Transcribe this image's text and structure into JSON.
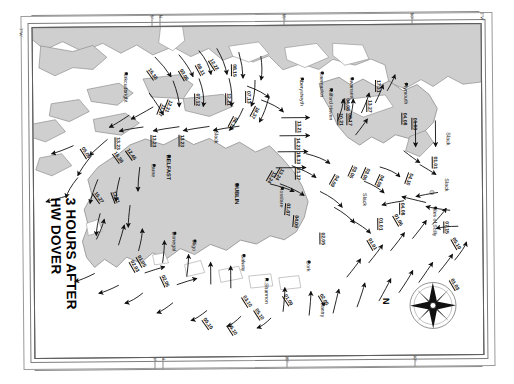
{
  "chart": {
    "title_line1": "3 HOURS AFTER",
    "title_line2": "HW DOVER",
    "compass_north_label": "N",
    "slack_labels": [
      "Slack",
      "Slack",
      "Slack",
      "Slack"
    ]
  },
  "graticule": {
    "top_ticks": [
      "5°",
      "N",
      "55°",
      "50°",
      "3°W"
    ],
    "left_label": "7°W",
    "bottom_ticks": [
      "5°",
      "N",
      "55°",
      "50°"
    ]
  },
  "places": [
    {
      "name": "Kirkcudbright",
      "x": 96,
      "y": 45
    },
    {
      "name": "Caernarfon",
      "x": 292,
      "y": 46
    },
    {
      "name": "Aberystwyth",
      "x": 272,
      "y": 52
    },
    {
      "name": "Swansea",
      "x": 322,
      "y": 52
    },
    {
      "name": "Milford Haven",
      "x": 301,
      "y": 63
    },
    {
      "name": "Plymouth",
      "x": 376,
      "y": 58
    },
    {
      "name": "Larne",
      "x": 123,
      "y": 137
    },
    {
      "name": "BELFAST",
      "x": 138,
      "y": 128
    },
    {
      "name": "DUBLIN",
      "x": 206,
      "y": 157
    },
    {
      "name": "Rosslare",
      "x": 251,
      "y": 161
    },
    {
      "name": "Donegal",
      "x": 143,
      "y": 205
    },
    {
      "name": "Sligo",
      "x": 163,
      "y": 213
    },
    {
      "name": "Galway",
      "x": 212,
      "y": 228
    },
    {
      "name": "R.Shannon",
      "x": 235,
      "y": 252
    },
    {
      "name": "Cork",
      "x": 277,
      "y": 235
    },
    {
      "name": "Bantry",
      "x": 291,
      "y": 277
    },
    {
      "name": "Isles of Scilly",
      "x": 404,
      "y": 182
    }
  ],
  "rates": [
    {
      "value": "16.38",
      "x": 119,
      "y": 40,
      "rot": 55
    },
    {
      "value": "03.06",
      "x": 151,
      "y": 41,
      "rot": 60
    },
    {
      "value": "08.11",
      "x": 168,
      "y": 36,
      "rot": 62
    },
    {
      "value": "12.22",
      "x": 181,
      "y": 31,
      "rot": 58
    },
    {
      "value": "08.15",
      "x": 205,
      "y": 38,
      "rot": 90
    },
    {
      "value": "07.12",
      "x": 168,
      "y": 67,
      "rot": 90
    },
    {
      "value": "12.21",
      "x": 199,
      "y": 67,
      "rot": 90
    },
    {
      "value": "07.13",
      "x": 219,
      "y": 65,
      "rot": 90
    },
    {
      "value": "11.37",
      "x": 134,
      "y": 79,
      "rot": 112
    },
    {
      "value": "12.31",
      "x": 141,
      "y": 75,
      "rot": 112
    },
    {
      "value": "18.37",
      "x": 228,
      "y": 83,
      "rot": 118
    },
    {
      "value": "06.12",
      "x": 206,
      "y": 93,
      "rot": 118
    },
    {
      "value": "13.23",
      "x": 124,
      "y": 108,
      "rot": 90
    },
    {
      "value": "13.23",
      "x": 152,
      "y": 108,
      "rot": 90
    },
    {
      "value": "13.23",
      "x": 88,
      "y": 110,
      "rot": 90
    },
    {
      "value": "13.21",
      "x": 269,
      "y": 95,
      "rot": 90
    },
    {
      "value": "14.23",
      "x": 268,
      "y": 112,
      "rot": 90
    },
    {
      "value": "18.33",
      "x": 268,
      "y": 126,
      "rot": 90
    },
    {
      "value": "21.37",
      "x": 268,
      "y": 142,
      "rot": 90
    },
    {
      "value": "05.09",
      "x": 52,
      "y": 118,
      "rot": 58
    },
    {
      "value": "16.38",
      "x": 84,
      "y": 123,
      "rot": 55
    },
    {
      "value": "12.46",
      "x": 97,
      "y": 120,
      "rot": 55
    },
    {
      "value": "15.27",
      "x": 64,
      "y": 163,
      "rot": 55
    },
    {
      "value": "12.21",
      "x": 83,
      "y": 163,
      "rot": 70
    },
    {
      "value": "02.03",
      "x": 100,
      "y": 232,
      "rot": 60
    },
    {
      "value": "01.05",
      "x": 107,
      "y": 227,
      "rot": 60
    },
    {
      "value": "02.05",
      "x": 131,
      "y": 247,
      "rot": 65
    },
    {
      "value": "05.10",
      "x": 172,
      "y": 290,
      "rot": 55
    },
    {
      "value": "05.10",
      "x": 197,
      "y": 296,
      "rot": 58
    },
    {
      "value": "03.10",
      "x": 212,
      "y": 268,
      "rot": 58
    },
    {
      "value": "05.10",
      "x": 224,
      "y": 281,
      "rot": 58
    },
    {
      "value": "01.09",
      "x": 253,
      "y": 267,
      "rot": 58
    },
    {
      "value": "02.05",
      "x": 289,
      "y": 267,
      "rot": 60
    },
    {
      "value": "02.05",
      "x": 292,
      "y": 207,
      "rot": 90
    },
    {
      "value": "01.07",
      "x": 258,
      "y": 178,
      "rot": 95
    },
    {
      "value": "04.09",
      "x": 266,
      "y": 190,
      "rot": 95
    },
    {
      "value": "13.24",
      "x": 244,
      "y": 148,
      "rot": 120
    },
    {
      "value": "13.24",
      "x": 252,
      "y": 145,
      "rot": 120
    },
    {
      "value": "04.09",
      "x": 307,
      "y": 152,
      "rot": 120
    },
    {
      "value": "03.06",
      "x": 325,
      "y": 143,
      "rot": 115
    },
    {
      "value": "10.21",
      "x": 311,
      "y": 88,
      "rot": 90
    },
    {
      "value": "08.17",
      "x": 320,
      "y": 88,
      "rot": 90
    },
    {
      "value": "04.08",
      "x": 318,
      "y": 73,
      "rot": 90
    },
    {
      "value": "13.27",
      "x": 340,
      "y": 75,
      "rot": 90
    },
    {
      "value": "17.31",
      "x": 349,
      "y": 55,
      "rot": 90
    },
    {
      "value": "04.08",
      "x": 375,
      "y": 88,
      "rot": 90
    },
    {
      "value": "01.03",
      "x": 385,
      "y": 93,
      "rot": 90
    },
    {
      "value": "04.10",
      "x": 381,
      "y": 150,
      "rot": 110
    },
    {
      "value": "04.09",
      "x": 352,
      "y": 152,
      "rot": 115
    },
    {
      "value": "03.06",
      "x": 338,
      "y": 145,
      "rot": 115
    },
    {
      "value": "04.08",
      "x": 372,
      "y": 178,
      "rot": 90
    },
    {
      "value": "01.01",
      "x": 405,
      "y": 132,
      "rot": 90
    },
    {
      "value": "01.01",
      "x": 350,
      "y": 193,
      "rot": 90
    },
    {
      "value": "01.06",
      "x": 364,
      "y": 188,
      "rot": 60
    },
    {
      "value": "07.15",
      "x": 416,
      "y": 197,
      "rot": 90
    },
    {
      "value": "05.10",
      "x": 422,
      "y": 212,
      "rot": 60
    },
    {
      "value": "01.01",
      "x": 338,
      "y": 212,
      "rot": 60
    },
    {
      "value": "01.03",
      "x": 420,
      "y": 253,
      "rot": 60
    }
  ],
  "colors": {
    "land": "#cfcfcf",
    "sea": "#ffffff",
    "coastline": "#8f8f8f",
    "ink": "#111111",
    "frame": "#5e5e5e"
  }
}
